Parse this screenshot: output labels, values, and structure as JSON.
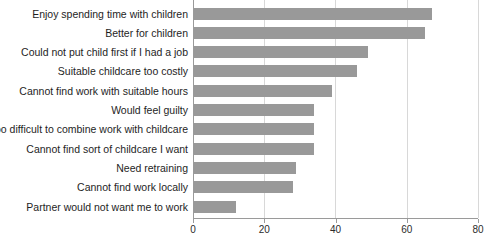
{
  "chart_data": {
    "type": "bar",
    "orientation": "horizontal",
    "title": "",
    "subtitle": "",
    "xlabel": "",
    "ylabel": "",
    "xlim": [
      0,
      80
    ],
    "ylim": null,
    "grid": true,
    "legend": false,
    "legend_position": "none",
    "bar_color": "#999999",
    "axis_color": "#9a9a9a",
    "gridline_color": "#d8d8d8",
    "xticks": [
      0,
      20,
      40,
      60,
      80
    ],
    "xtick_labels": [
      "0",
      "20",
      "40",
      "60",
      "80"
    ],
    "categories": [
      "Enjoy spending time with children",
      "Better for children",
      "Could not put child first if I had a job",
      "Suitable childcare too costly",
      "Cannot find work with suitable hours",
      "Would feel guilty",
      "Too difficult to combine work with childcare",
      "Cannot find sort of childcare I want",
      "Need retraining",
      "Cannot find work locally",
      "Partner would not want me to work"
    ],
    "values": [
      67,
      65,
      49,
      46,
      39,
      34,
      34,
      34,
      29,
      28,
      12
    ]
  }
}
